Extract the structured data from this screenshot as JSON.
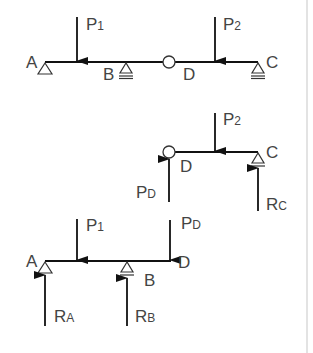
{
  "figure": {
    "colors": {
      "line": "#111111",
      "text": "#444444",
      "background": "#ffffff",
      "border": "#d0d0d0"
    }
  },
  "diagram1": {
    "title": "Compound beam A-B-D-C",
    "labels": {
      "A": "A",
      "B": "B",
      "D": "D",
      "C": "C"
    },
    "loads": {
      "p1": {
        "main": "P",
        "sub": "1"
      },
      "p2": {
        "main": "P",
        "sub": "2"
      }
    },
    "supports": [
      "pin-A",
      "roller-B",
      "hinge-D",
      "roller-C"
    ]
  },
  "diagram2": {
    "title": "Free body D-C",
    "labels": {
      "D": "D",
      "C": "C"
    },
    "loads": {
      "p2": {
        "main": "P",
        "sub": "2"
      },
      "pd": {
        "main": "P",
        "sub": "D"
      }
    },
    "reactions": {
      "rc": {
        "main": "R",
        "sub": "C"
      }
    }
  },
  "diagram3": {
    "title": "Free body A-B-D",
    "labels": {
      "A": "A",
      "B": "B",
      "D": "D"
    },
    "loads": {
      "p1": {
        "main": "P",
        "sub": "1"
      },
      "pd": {
        "main": "P",
        "sub": "D"
      }
    },
    "reactions": {
      "ra": {
        "main": "R",
        "sub": "A"
      },
      "rb": {
        "main": "R",
        "sub": "B"
      }
    }
  }
}
